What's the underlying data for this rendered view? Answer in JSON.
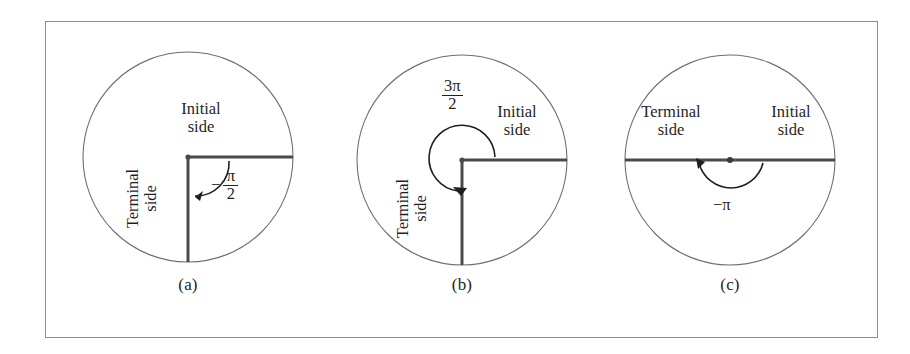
{
  "figure": {
    "type": "math-diagram",
    "topic": "Angles in standard position on a circle",
    "frame": {
      "border_color": "#8d8d8d"
    },
    "colors": {
      "circle_stroke": "#6f6f6f",
      "ray_stroke": "#4a4a4a",
      "arc_stroke": "#1f1f1f",
      "text": "#1f1f1f",
      "background": "#ffffff"
    }
  },
  "panels": [
    {
      "id": "a",
      "caption": "(a)",
      "initial_side_label_line1": "Initial",
      "initial_side_label_line2": "side",
      "terminal_side_label_line1": "Terminal",
      "terminal_side_label_line2": "side",
      "angle": {
        "display": "−π/2",
        "sign": "−",
        "numerator": "π",
        "denominator": "2",
        "value_radians": -1.5708,
        "value_degrees": -90,
        "direction": "clockwise"
      },
      "geometry": {
        "center_x": 145,
        "center_y": 157,
        "radius": 105,
        "initial_side_angle_deg": 0,
        "terminal_side_angle_deg": -90
      }
    },
    {
      "id": "b",
      "caption": "(b)",
      "initial_side_label_line1": "Initial",
      "initial_side_label_line2": "side",
      "terminal_side_label_line1": "Terminal",
      "terminal_side_label_line2": "side",
      "angle": {
        "display": "3π/2",
        "sign": "",
        "numerator": "3π",
        "denominator": "2",
        "value_radians": 4.7124,
        "value_degrees": 270,
        "direction": "counterclockwise"
      },
      "geometry": {
        "center_x": 145,
        "center_y": 160,
        "radius": 105,
        "initial_side_angle_deg": 0,
        "terminal_side_angle_deg": -90
      }
    },
    {
      "id": "c",
      "caption": "(c)",
      "initial_side_label_line1": "Initial",
      "initial_side_label_line2": "side",
      "terminal_side_label_line1": "Terminal",
      "terminal_side_label_line2": "side",
      "angle": {
        "display": "−π",
        "sign": "−",
        "numerator": "π",
        "denominator": "",
        "value_radians": -3.1416,
        "value_degrees": -180,
        "direction": "clockwise"
      },
      "geometry": {
        "center_x": 145,
        "center_y": 160,
        "radius": 105,
        "initial_side_angle_deg": 0,
        "terminal_side_angle_deg": 180
      }
    }
  ]
}
